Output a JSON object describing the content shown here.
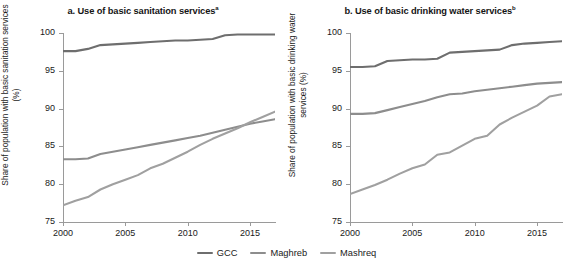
{
  "figure": {
    "legend": {
      "items": [
        {
          "label": "GCC",
          "color": "#6e6e6e"
        },
        {
          "label": "Maghreb",
          "color": "#8d8d8d"
        },
        {
          "label": "Mashreq",
          "color": "#a0a0a0"
        }
      ]
    }
  },
  "chart_data": [
    {
      "type": "line",
      "panel": "a",
      "title": "a. Use of basic sanitation services",
      "title_superscript": "a",
      "xlabel": "",
      "ylabel": "Share of population with\nbasic sanitation services (%)",
      "xlim": [
        2000,
        2017
      ],
      "ylim": [
        75,
        100
      ],
      "xticks": [
        2000,
        2005,
        2010,
        2015
      ],
      "yticks": [
        75,
        80,
        85,
        90,
        95,
        100
      ],
      "grid": false,
      "legend_position": "bottom",
      "x": [
        2000,
        2001,
        2002,
        2003,
        2004,
        2005,
        2006,
        2007,
        2008,
        2009,
        2010,
        2011,
        2012,
        2013,
        2014,
        2015,
        2016,
        2017
      ],
      "series": [
        {
          "name": "GCC",
          "color": "#6e6e6e",
          "values": [
            97.6,
            97.6,
            97.9,
            98.4,
            98.5,
            98.6,
            98.7,
            98.8,
            98.9,
            99.0,
            99.0,
            99.1,
            99.2,
            99.7,
            99.8,
            99.8,
            99.8,
            99.8
          ]
        },
        {
          "name": "Maghreb",
          "color": "#8d8d8d",
          "values": [
            83.3,
            83.3,
            83.4,
            84.0,
            84.3,
            84.6,
            84.9,
            85.2,
            85.5,
            85.8,
            86.1,
            86.4,
            86.8,
            87.2,
            87.6,
            88.0,
            88.3,
            88.6
          ]
        },
        {
          "name": "Mashreq",
          "color": "#a0a0a0",
          "values": [
            77.2,
            77.8,
            78.3,
            79.3,
            80.0,
            80.6,
            81.2,
            82.1,
            82.7,
            83.5,
            84.3,
            85.2,
            86.0,
            86.7,
            87.4,
            88.2,
            88.9,
            89.6
          ]
        }
      ]
    },
    {
      "type": "line",
      "panel": "b",
      "title": "b. Use of basic drinking water services",
      "title_superscript": "b",
      "xlabel": "",
      "ylabel": "Share of population with\nbasic drinking water services (%)",
      "xlim": [
        2000,
        2017
      ],
      "ylim": [
        75,
        100
      ],
      "xticks": [
        2000,
        2005,
        2010,
        2015
      ],
      "yticks": [
        75,
        80,
        85,
        90,
        95,
        100
      ],
      "grid": false,
      "legend_position": "bottom",
      "x": [
        2000,
        2001,
        2002,
        2003,
        2004,
        2005,
        2006,
        2007,
        2008,
        2009,
        2010,
        2011,
        2012,
        2013,
        2014,
        2015,
        2016,
        2017
      ],
      "series": [
        {
          "name": "GCC",
          "color": "#6e6e6e",
          "values": [
            95.5,
            95.5,
            95.6,
            96.3,
            96.4,
            96.5,
            96.5,
            96.6,
            97.4,
            97.5,
            97.6,
            97.7,
            97.8,
            98.4,
            98.6,
            98.7,
            98.8,
            98.9
          ]
        },
        {
          "name": "Maghreb",
          "color": "#8d8d8d",
          "values": [
            89.3,
            89.3,
            89.4,
            89.8,
            90.2,
            90.6,
            91.0,
            91.5,
            91.9,
            92.0,
            92.3,
            92.5,
            92.7,
            92.9,
            93.1,
            93.3,
            93.4,
            93.5
          ]
        },
        {
          "name": "Mashreq",
          "color": "#a0a0a0",
          "values": [
            78.7,
            79.3,
            79.9,
            80.6,
            81.4,
            82.1,
            82.6,
            83.9,
            84.2,
            85.1,
            86.0,
            86.4,
            87.9,
            88.8,
            89.6,
            90.4,
            91.6,
            91.9
          ]
        }
      ]
    }
  ]
}
